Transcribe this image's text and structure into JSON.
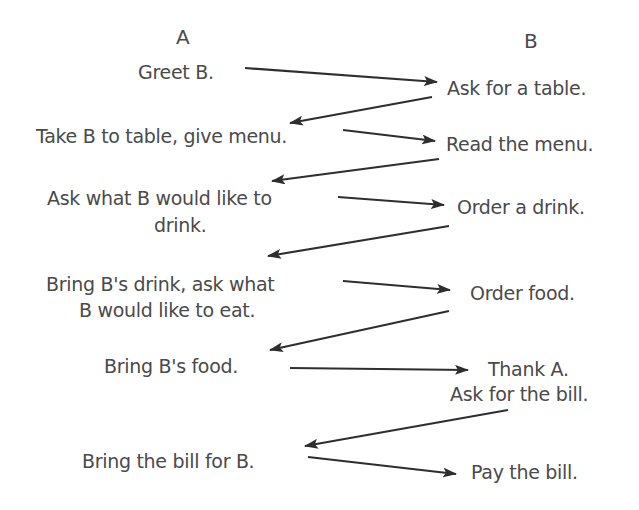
{
  "headers": {
    "a": "A",
    "b": "B"
  },
  "a_steps": [
    "Greet B.",
    "Take B to table, give menu.",
    "Ask what B would like to",
    "drink.",
    "Bring B's drink, ask what",
    "B would like to eat.",
    "Bring B's food.",
    "Bring the bill for B."
  ],
  "b_steps": [
    "Ask for a table.",
    "Read the menu.",
    "Order a drink.",
    "Order food.",
    "Thank A.",
    "Ask for the bill.",
    "Pay the bill."
  ],
  "arrows": [
    {
      "from": "Greet B.",
      "to": "Ask for a table."
    },
    {
      "from": "Ask for a table.",
      "to": "Take B to table, give menu."
    },
    {
      "from": "Take B to table, give menu.",
      "to": "Read the menu."
    },
    {
      "from": "Read the menu.",
      "to": "Ask what B would like to drink."
    },
    {
      "from": "Ask what B would like to drink.",
      "to": "Order a drink."
    },
    {
      "from": "Order a drink.",
      "to": "Bring B's drink, ask what B would like to eat."
    },
    {
      "from": "Bring B's drink, ask what B would like to eat.",
      "to": "Order food."
    },
    {
      "from": "Order food.",
      "to": "Bring B's food."
    },
    {
      "from": "Bring B's food.",
      "to": "Thank A."
    },
    {
      "from": "Ask for the bill.",
      "to": "Bring the bill for B."
    },
    {
      "from": "Bring the bill for B.",
      "to": "Pay the bill."
    }
  ],
  "colors": {
    "text": "#4a4a4a",
    "arrow": "#2e2e2e",
    "background": "#ffffff"
  }
}
